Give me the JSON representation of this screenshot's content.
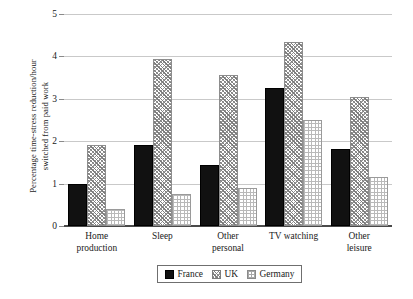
{
  "chart_data": {
    "type": "bar",
    "title": "",
    "xlabel": "",
    "ylabel": "Percentage time-stress reduction/hour switched from paid work",
    "ylabel_line1": "Percentage time-stress reduction/hour",
    "ylabel_line2": "switched from paid work",
    "ylim": [
      0,
      5
    ],
    "ytick_labels": [
      "0",
      "1",
      "2",
      "3",
      "4",
      "5"
    ],
    "ytick_values": [
      0,
      1,
      2,
      3,
      4,
      5
    ],
    "grid": true,
    "legend_position": "bottom-center",
    "categories": [
      "Home production",
      "Sleep",
      "Other personal",
      "TV watching",
      "Other leisure"
    ],
    "category_lines": [
      [
        "Home",
        "production"
      ],
      [
        "Sleep"
      ],
      [
        "Other",
        "personal"
      ],
      [
        "TV watching"
      ],
      [
        "Other",
        "leisure"
      ]
    ],
    "series": [
      {
        "name": "France",
        "pattern": "solid",
        "color": "#111111",
        "values": [
          1.0,
          1.9,
          1.45,
          3.25,
          1.82
        ]
      },
      {
        "name": "UK",
        "pattern": "hatch",
        "color": "#8d8d8d",
        "values": [
          1.9,
          3.95,
          3.55,
          4.35,
          3.05
        ]
      },
      {
        "name": "Germany",
        "pattern": "dotted",
        "color": "#b9b9b9",
        "values": [
          0.4,
          0.75,
          0.9,
          2.5,
          1.16
        ]
      }
    ]
  },
  "legend": {
    "items": [
      {
        "label": "France",
        "pattern": "solid"
      },
      {
        "label": "UK",
        "pattern": "hatch"
      },
      {
        "label": "Germany",
        "pattern": "dotted"
      }
    ]
  }
}
